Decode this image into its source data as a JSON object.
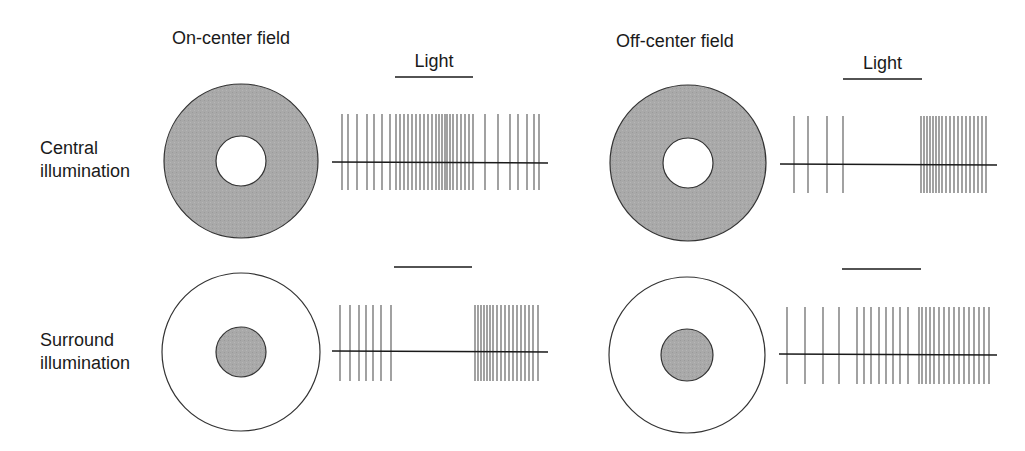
{
  "colors": {
    "background": "#ffffff",
    "ink": "#1a1a1a",
    "spike": "#555555",
    "shade": "#a8a8a8"
  },
  "headers": {
    "on_center": "On-center field",
    "off_center": "Off-center field"
  },
  "row_labels": {
    "central": [
      "Central",
      "illumination"
    ],
    "surround": [
      "Surround",
      "illumination"
    ]
  },
  "light_label": "Light",
  "panels": [
    {
      "id": "on-central",
      "field": "on-center",
      "illumination": "central",
      "circle": {
        "cx": 241,
        "cy": 161,
        "r_outer": 77,
        "r_inner": 25,
        "outer_shaded": true,
        "inner_shaded": false
      },
      "trace": {
        "x1": 332,
        "x2": 548,
        "y": 162,
        "spike_top": 114,
        "spike_bottom": 190,
        "spikes": [
          342,
          348,
          357,
          367,
          374,
          382,
          390,
          396,
          400,
          404,
          408,
          412,
          416,
          420,
          424,
          428,
          432,
          436,
          439,
          442,
          445,
          447,
          450,
          453,
          457,
          461,
          465,
          469,
          473,
          485,
          498,
          510,
          518,
          527,
          534,
          539
        ]
      },
      "light_bar": {
        "x1": 395,
        "x2": 473,
        "y": 77,
        "show_label": true
      }
    },
    {
      "id": "on-surround",
      "field": "on-center",
      "illumination": "surround",
      "circle": {
        "cx": 241,
        "cy": 352,
        "r_outer": 79,
        "r_inner": 25,
        "outer_shaded": false,
        "inner_shaded": true
      },
      "trace": {
        "x1": 332,
        "x2": 548,
        "y": 351,
        "spike_top": 305,
        "spike_bottom": 381,
        "spikes": [
          340,
          350,
          359,
          366,
          373,
          381,
          391,
          475,
          478,
          481,
          484,
          487,
          490,
          493,
          497,
          501,
          505,
          509,
          513,
          517,
          521,
          525,
          529,
          533,
          538
        ]
      },
      "light_bar": {
        "x1": 394,
        "x2": 472,
        "y": 267,
        "show_label": false
      }
    },
    {
      "id": "off-central",
      "field": "off-center",
      "illumination": "central",
      "circle": {
        "cx": 688,
        "cy": 163,
        "r_outer": 78,
        "r_inner": 25,
        "outer_shaded": true,
        "inner_shaded": false
      },
      "trace": {
        "x1": 780,
        "x2": 997,
        "y": 164,
        "spike_top": 116,
        "spike_bottom": 193,
        "spikes": [
          794,
          808,
          827,
          843,
          921,
          924,
          927,
          930,
          933,
          936,
          939,
          942,
          946,
          950,
          954,
          958,
          962,
          966,
          970,
          974,
          978,
          982,
          986
        ]
      },
      "light_bar": {
        "x1": 843,
        "x2": 922,
        "y": 79,
        "show_label": true
      }
    },
    {
      "id": "off-surround",
      "field": "off-center",
      "illumination": "surround",
      "circle": {
        "cx": 687,
        "cy": 355,
        "r_outer": 78,
        "r_inner": 26,
        "outer_shaded": false,
        "inner_shaded": true
      },
      "trace": {
        "x1": 779,
        "x2": 997,
        "y": 354,
        "spike_top": 307,
        "spike_bottom": 384,
        "spikes": [
          787,
          805,
          823,
          839,
          857,
          864,
          871,
          879,
          886,
          893,
          900,
          908,
          919,
          922,
          926,
          930,
          934,
          939,
          944,
          949,
          954,
          959,
          964,
          969,
          974,
          979,
          984,
          989
        ]
      },
      "light_bar": {
        "x1": 842,
        "x2": 921,
        "y": 269,
        "show_label": false
      }
    }
  ]
}
